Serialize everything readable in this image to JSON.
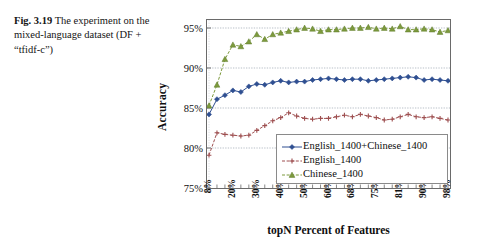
{
  "caption": {
    "fig_label": "Fig. 3.19",
    "text": "The experiment on the mixed-language dataset (DF + “tfidf-c”)"
  },
  "chart_data": {
    "type": "line",
    "title": "",
    "xlabel": "topN Percent of Features",
    "ylabel": "Accuracy",
    "ylim": [
      75,
      96
    ],
    "ytick_labels": [
      "75%",
      "80%",
      "85%",
      "90%",
      "95%"
    ],
    "ytick_values": [
      75,
      80,
      85,
      90,
      95
    ],
    "xtick_labels": [
      "8%",
      "20%",
      "30%",
      "40%",
      "50%",
      "60%",
      "68%",
      "75%",
      "81%",
      "90%",
      "98%"
    ],
    "xtick_indices": [
      0,
      3,
      6,
      9,
      12,
      15,
      18,
      21,
      24,
      27,
      30
    ],
    "grid": "horizontal-dotted",
    "legend_position": "lower-right-inside",
    "n_points": 31,
    "series": [
      {
        "name": "English_1400+Chinese_1400",
        "color": "#2f4f91",
        "marker": "diamond",
        "line_style": "solid",
        "values": [
          84.2,
          86.1,
          86.6,
          87.2,
          87.0,
          87.7,
          88.0,
          87.9,
          88.2,
          88.4,
          88.2,
          88.3,
          88.3,
          88.5,
          88.6,
          88.7,
          88.6,
          88.5,
          88.6,
          88.6,
          88.4,
          88.5,
          88.6,
          88.7,
          88.8,
          88.9,
          88.8,
          88.5,
          88.6,
          88.5,
          88.4
        ]
      },
      {
        "name": "English_1400",
        "color": "#9e4f50",
        "marker": "plus",
        "line_style": "dashed",
        "values": [
          79.1,
          81.9,
          81.7,
          81.6,
          81.5,
          81.6,
          82.2,
          82.8,
          83.4,
          83.8,
          84.4,
          84.0,
          83.7,
          83.6,
          83.7,
          83.7,
          83.9,
          84.1,
          83.9,
          84.2,
          84.0,
          83.8,
          83.5,
          83.6,
          83.9,
          84.2,
          83.9,
          83.8,
          83.9,
          83.7,
          83.5
        ]
      },
      {
        "name": "Chinese_1400",
        "color": "#7d9a3d",
        "marker": "triangle",
        "line_style": "dashed",
        "values": [
          85.3,
          87.9,
          91.1,
          92.9,
          92.7,
          93.3,
          94.2,
          93.6,
          94.2,
          94.4,
          94.6,
          94.8,
          95.0,
          94.9,
          94.6,
          94.8,
          94.8,
          94.9,
          95.0,
          95.0,
          95.1,
          94.9,
          95.0,
          94.9,
          95.2,
          94.8,
          94.8,
          94.9,
          94.8,
          94.5,
          94.7
        ]
      }
    ]
  },
  "legend": {
    "items": [
      {
        "label": "English_1400+Chinese_1400"
      },
      {
        "label": "English_1400"
      },
      {
        "label": "Chinese_1400"
      }
    ]
  }
}
